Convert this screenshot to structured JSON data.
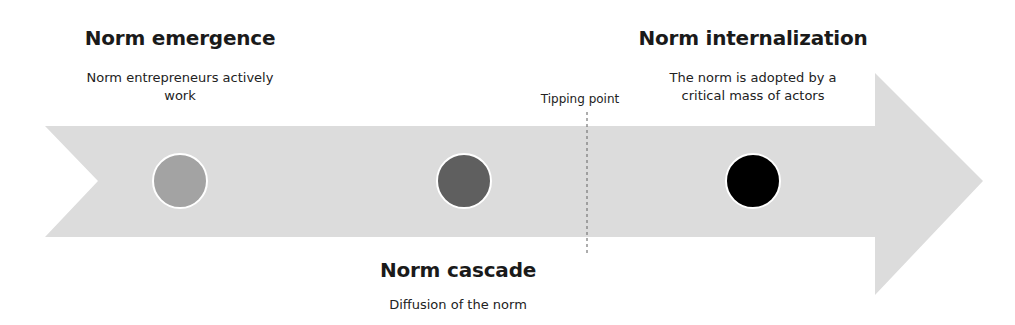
{
  "diagram": {
    "type": "process-arrow-timeline",
    "colors": {
      "arrow": "#dcdcdc",
      "circle_stroke": "#ffffff",
      "tipping_line": "#777777",
      "text": "#1a1a1a"
    },
    "stages": [
      {
        "title": "Norm emergence",
        "description": "Norm entrepreneurs actively work",
        "circle_color": "#a3a3a3",
        "position": "top"
      },
      {
        "title": "Norm cascade",
        "description": "Diffusion of the norm",
        "circle_color": "#5f5f5f",
        "position": "bottom"
      },
      {
        "title": "Norm internalization",
        "description": "The norm is adopted by a critical mass of actors",
        "circle_color": "#000000",
        "position": "top"
      }
    ],
    "tipping_point": {
      "label": "Tipping point"
    }
  }
}
